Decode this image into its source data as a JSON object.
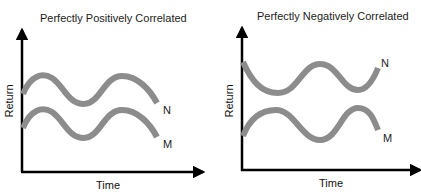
{
  "panels": [
    {
      "title": "Perfectly Positively Correlated",
      "xlabel": "Time",
      "ylabel": "Return",
      "series": [
        {
          "name": "N",
          "phase": "in-phase"
        },
        {
          "name": "M",
          "phase": "in-phase"
        }
      ]
    },
    {
      "title": "Perfectly Negatively Correlated",
      "xlabel": "Time",
      "ylabel": "Return",
      "series": [
        {
          "name": "N",
          "phase": "inverted"
        },
        {
          "name": "M",
          "phase": "normal"
        }
      ]
    }
  ],
  "colors": {
    "curve": "#8c8c8c",
    "axis": "#000000"
  }
}
